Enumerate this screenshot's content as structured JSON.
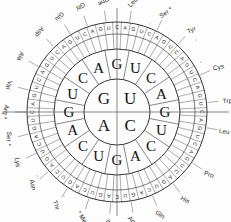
{
  "figure": {
    "type": "codon-circle",
    "center": {
      "x": 117,
      "y": 112
    },
    "radii": {
      "inner": 33,
      "ring2_outer": 63,
      "ring3_outer": 78,
      "ticks_outer": 90
    },
    "colors": {
      "ink": "#111111",
      "line": "#333333",
      "label": "#2a2a2a",
      "background": "#fdfdfd"
    }
  },
  "inner_circle": {
    "name": "first-base-ring",
    "bases": [
      {
        "base": "G",
        "quadrant": "top-left"
      },
      {
        "base": "U",
        "quadrant": "top-right"
      },
      {
        "base": "C",
        "quadrant": "bottom-right"
      },
      {
        "base": "A",
        "quadrant": "bottom-left"
      }
    ]
  },
  "ring2": {
    "name": "second-base-ring",
    "sector_count": 16,
    "letters_clockwise_from_top": [
      "G",
      "U",
      "C",
      "A",
      "G",
      "U",
      "C",
      "A",
      "G",
      "U",
      "C",
      "A",
      "G",
      "U",
      "C",
      "A"
    ]
  },
  "ring3": {
    "name": "third-base-ring",
    "sector_count": 64,
    "letters_clockwise_from_top": [
      "C",
      "A",
      "G",
      "U",
      "C",
      "A",
      "G",
      "U",
      "C",
      "A",
      "G",
      "U",
      "C",
      "A",
      "G",
      "U",
      "C",
      "A",
      "G",
      "U",
      "C",
      "A",
      "G",
      "U",
      "C",
      "A",
      "G",
      "U",
      "C",
      "A",
      "G",
      "U",
      "C",
      "A",
      "G",
      "U",
      "C",
      "A",
      "G",
      "U",
      "C",
      "A",
      "G",
      "U",
      "C",
      "A",
      "G",
      "U",
      "C",
      "A",
      "G",
      "U",
      "C",
      "A",
      "G",
      "U",
      "C",
      "A",
      "G",
      "U",
      "C",
      "A",
      "G",
      "U"
    ]
  },
  "amino_acid_labels": [
    {
      "text": "Phe",
      "angle_deg": 353
    },
    {
      "text": "Leu",
      "angle_deg": 8
    },
    {
      "text": "Ser *",
      "angle_deg": 26
    },
    {
      "text": "Tyr",
      "angle_deg": 42
    },
    {
      "text": "Cys",
      "angle_deg": 66
    },
    {
      "text": "Trp",
      "angle_deg": 84
    },
    {
      "text": "Leu *",
      "angle_deg": 100
    },
    {
      "text": "Pro",
      "angle_deg": 124
    },
    {
      "text": "His",
      "angle_deg": 142
    },
    {
      "text": "Gln",
      "angle_deg": 157
    },
    {
      "text": "Arg *",
      "angle_deg": 171
    },
    {
      "text": "Ile",
      "angle_deg": 184
    },
    {
      "text": "* Met",
      "angle_deg": 198
    },
    {
      "text": "Thr",
      "angle_deg": 213
    },
    {
      "text": "Asn",
      "angle_deg": 229
    },
    {
      "text": "Lys",
      "angle_deg": 243
    },
    {
      "text": "Ser *",
      "angle_deg": 256
    },
    {
      "text": "Arg *",
      "angle_deg": 270
    },
    {
      "text": "Val",
      "angle_deg": 284
    },
    {
      "text": "Ala",
      "angle_deg": 300
    },
    {
      "text": "Asp",
      "angle_deg": 316
    },
    {
      "text": "Glu",
      "angle_deg": 329
    },
    {
      "text": "Gly",
      "angle_deg": 341
    }
  ]
}
